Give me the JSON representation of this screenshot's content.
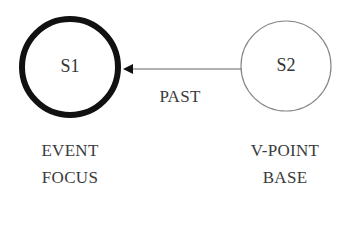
{
  "diagram": {
    "nodes": [
      {
        "id": "S1",
        "label": "S1",
        "caption_lines": [
          "EVENT",
          "FOCUS"
        ],
        "emphasis": "bold-outline"
      },
      {
        "id": "S2",
        "label": "S2",
        "caption_lines": [
          "V-POINT",
          "BASE"
        ],
        "emphasis": "thin-outline"
      }
    ],
    "edges": [
      {
        "from": "S2",
        "to": "S1",
        "label": "PAST",
        "arrow": "to-S1"
      }
    ]
  },
  "colors": {
    "stroke": "#1a1a1a",
    "thin_stroke": "#777777",
    "text": "#333333"
  }
}
